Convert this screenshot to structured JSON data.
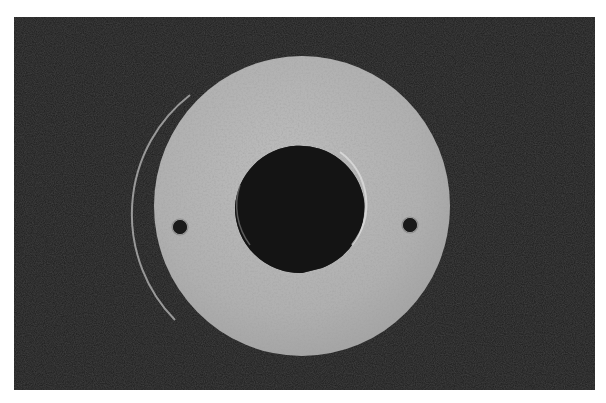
{
  "image": {
    "subject": "jade bi disc",
    "description": "Photograph of a flat circular stone ring (bi disc) with a large central hole and two small drilled holes on either side, on a dark background",
    "colors": {
      "page_background": "#ffffff",
      "photo_background": "#1d1d1d",
      "disc": "#b3b3b3",
      "disc_shade": "#9c9c9c",
      "disc_highlight": "#dcdcdc",
      "hole": "#141414"
    },
    "disc": {
      "outer": {
        "cx": 302,
        "cy": 206,
        "rx": 148,
        "ry": 150
      },
      "inner": {
        "cx": 300,
        "cy": 207,
        "rx": 65,
        "ry": 65
      },
      "small_holes": [
        {
          "name": "left",
          "cx": 180,
          "cy": 227,
          "r": 7
        },
        {
          "name": "right",
          "cx": 410,
          "cy": 225,
          "r": 7
        }
      ]
    }
  }
}
